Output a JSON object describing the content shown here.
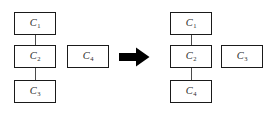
{
  "diagram": {
    "type": "tree-restructuring-diagram",
    "background_color": "#ffffff",
    "box_border_color": "#1a1a1a",
    "edge_color": "#4a4a4a",
    "arrow_color": "#000000",
    "arrow_icon": "right-arrow-icon",
    "left_side": {
      "chain": [
        {
          "id": "left-node-c1",
          "label": "C",
          "subscript": "1"
        },
        {
          "id": "left-node-c2",
          "label": "C",
          "subscript": "2"
        },
        {
          "id": "left-node-c3",
          "label": "C",
          "subscript": "3"
        }
      ],
      "isolated": {
        "id": "left-node-c4",
        "label": "C",
        "subscript": "4"
      },
      "edges": [
        {
          "from": "left-node-c1",
          "to": "left-node-c2"
        },
        {
          "from": "left-node-c2",
          "to": "left-node-c3"
        }
      ]
    },
    "right_side": {
      "chain": [
        {
          "id": "right-node-c1",
          "label": "C",
          "subscript": "1"
        },
        {
          "id": "right-node-c2",
          "label": "C",
          "subscript": "2"
        },
        {
          "id": "right-node-c4",
          "label": "C",
          "subscript": "4"
        }
      ],
      "isolated": {
        "id": "right-node-c3",
        "label": "C",
        "subscript": "3"
      },
      "edges": [
        {
          "from": "right-node-c1",
          "to": "right-node-c2"
        },
        {
          "from": "right-node-c2",
          "to": "right-node-c4"
        }
      ]
    }
  }
}
